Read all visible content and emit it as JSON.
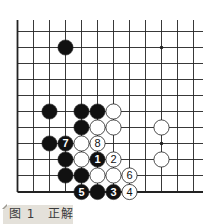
{
  "caption": "图 1　正解",
  "board": {
    "cols": 12,
    "rows": 11,
    "edges": [
      "left",
      "bottom"
    ],
    "star_points": [
      [
        9,
        1
      ],
      [
        9,
        7
      ]
    ],
    "colors": {
      "line": "#222222",
      "black": "#111111",
      "white": "#ffffff",
      "stone_outline": "#222222"
    },
    "stones": [
      {
        "c": 3,
        "r": 1,
        "color": "black"
      },
      {
        "c": 2,
        "r": 5,
        "color": "black"
      },
      {
        "c": 4,
        "r": 5,
        "color": "black"
      },
      {
        "c": 5,
        "r": 5,
        "color": "black"
      },
      {
        "c": 6,
        "r": 5,
        "color": "white"
      },
      {
        "c": 4,
        "r": 6,
        "color": "black"
      },
      {
        "c": 5,
        "r": 6,
        "color": "white"
      },
      {
        "c": 6,
        "r": 6,
        "color": "white"
      },
      {
        "c": 9,
        "r": 6,
        "color": "white"
      },
      {
        "c": 2,
        "r": 7,
        "color": "black"
      },
      {
        "c": 3,
        "r": 7,
        "color": "black",
        "label": "7"
      },
      {
        "c": 4,
        "r": 7,
        "color": "white"
      },
      {
        "c": 5,
        "r": 7,
        "color": "white",
        "label": "8"
      },
      {
        "c": 3,
        "r": 8,
        "color": "black"
      },
      {
        "c": 4,
        "r": 8,
        "color": "white"
      },
      {
        "c": 5,
        "r": 8,
        "color": "black",
        "label": "1"
      },
      {
        "c": 6,
        "r": 8,
        "color": "white",
        "label": "2"
      },
      {
        "c": 9,
        "r": 8,
        "color": "white"
      },
      {
        "c": 3,
        "r": 9,
        "color": "black"
      },
      {
        "c": 4,
        "r": 9,
        "color": "black"
      },
      {
        "c": 5,
        "r": 9,
        "color": "white"
      },
      {
        "c": 6,
        "r": 9,
        "color": "white"
      },
      {
        "c": 7,
        "r": 9,
        "color": "white",
        "label": "6"
      },
      {
        "c": 4,
        "r": 10,
        "color": "black",
        "label": "5"
      },
      {
        "c": 5,
        "r": 10,
        "color": "black"
      },
      {
        "c": 6,
        "r": 10,
        "color": "black",
        "label": "3"
      },
      {
        "c": 7,
        "r": 10,
        "color": "white",
        "label": "4"
      }
    ]
  }
}
